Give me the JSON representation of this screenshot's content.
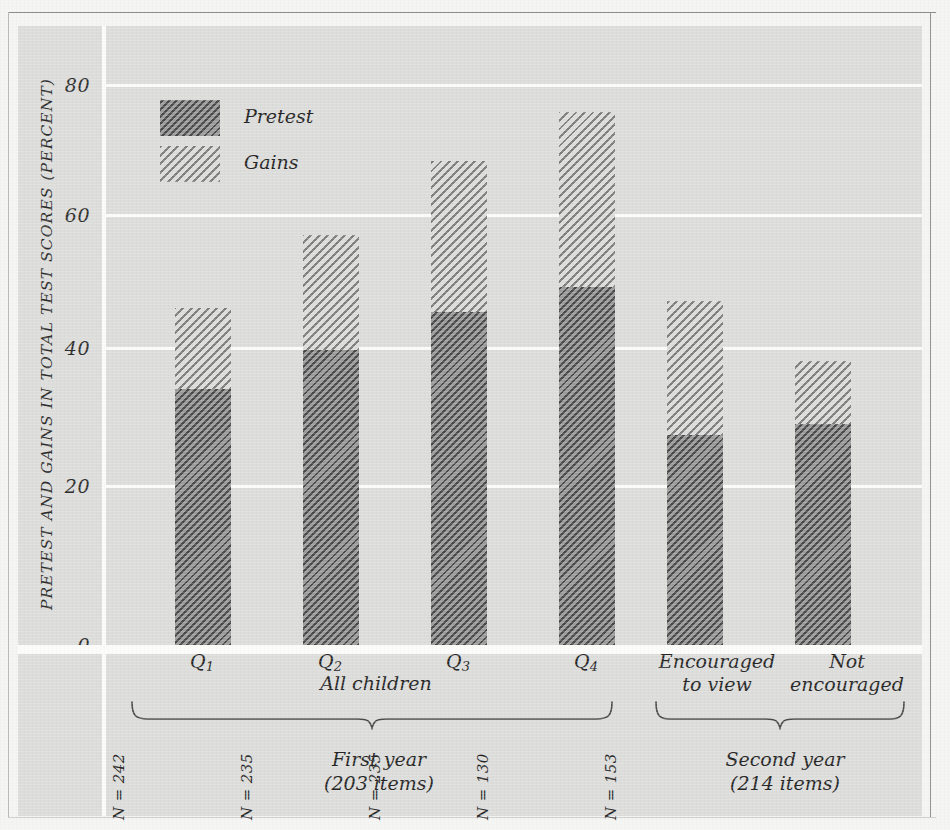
{
  "chart_data": {
    "type": "bar",
    "subtype": "stacked-bar",
    "title": "",
    "xlabel": "",
    "ylabel": "PRETEST AND GAINS IN TOTAL TEST SCORES (PERCENT)",
    "ylim": [
      0,
      88
    ],
    "yticks": [
      0,
      20,
      40,
      60,
      80
    ],
    "ytick_labels": [
      "0",
      "20",
      "40",
      "60",
      "80"
    ],
    "grid": "horizontal",
    "legend_position": "inside-top-left",
    "categories": [
      "Q1",
      "Q2",
      "Q3",
      "Q4",
      "Encouraged to view",
      "Not encouraged"
    ],
    "series": [
      {
        "name": "Pretest",
        "values": [
          36.5,
          42.0,
          47.5,
          51.0,
          30.0,
          31.5
        ]
      },
      {
        "name": "Gains",
        "values": [
          11.5,
          16.5,
          21.5,
          25.0,
          19.0,
          9.0
        ]
      }
    ],
    "totals": [
      48.0,
      58.5,
      69.0,
      76.0,
      49.0,
      40.5
    ],
    "annotations": [
      "N = 231",
      "N = 242",
      "N = 235",
      "N = 235",
      "N = 130",
      "N = 153"
    ],
    "groups": [
      {
        "label": "All children",
        "members": [
          "Q1",
          "Q2",
          "Q3",
          "Q4"
        ]
      },
      {
        "label": "First year\n(203 items)",
        "members": [
          "Q1",
          "Q2",
          "Q3",
          "Q4"
        ]
      },
      {
        "label": "Second year\n(214 items)",
        "members": [
          "Encouraged to view",
          "Not encouraged"
        ]
      }
    ]
  },
  "axis": {
    "y_title": "PRETEST AND GAINS IN TOTAL TEST SCORES (PERCENT)",
    "ticks": {
      "t80": "80",
      "t60": "60",
      "t40": "40",
      "t20": "20",
      "t0": "0"
    }
  },
  "legend": {
    "pretest_label": "Pretest",
    "gains_label": "Gains"
  },
  "bars": [
    {
      "id": "q1",
      "n_label": "N = 231",
      "pretest": 36.5,
      "gains": 11.5,
      "total": 48.0
    },
    {
      "id": "q2",
      "n_label": "N = 242",
      "pretest": 42.0,
      "gains": 16.5,
      "total": 58.5
    },
    {
      "id": "q3",
      "n_label": "N = 235",
      "pretest": 47.5,
      "gains": 21.5,
      "total": 69.0
    },
    {
      "id": "q4",
      "n_label": "N = 235",
      "pretest": 51.0,
      "gains": 25.0,
      "total": 76.0
    },
    {
      "id": "enc",
      "n_label": "N = 130",
      "pretest": 30.0,
      "gains": 19.0,
      "total": 49.0
    },
    {
      "id": "notenc",
      "n_label": "N = 153",
      "pretest": 31.5,
      "gains": 9.0,
      "total": 40.5
    }
  ],
  "categories": {
    "q1_main": "Q",
    "q1_sub": "1",
    "q2_main": "Q",
    "q2_sub": "2",
    "q3_main": "Q",
    "q3_sub": "3",
    "q4_main": "Q",
    "q4_sub": "4",
    "enc_line1": "Encouraged",
    "enc_line2": "to view",
    "notenc_line1": "Not",
    "notenc_line2": "encouraged"
  },
  "groups": {
    "all_children": "All children",
    "first_year_line1": "First year",
    "first_year_line2": "(203 items)",
    "second_year_line1": "Second year",
    "second_year_line2": "(214 items)"
  },
  "colors": {
    "paper": "#f4f4f2",
    "panel": "#dcdcda",
    "gridline": "#fbfbfa",
    "pretest_fill": "#9b9b9b",
    "gains_fill": "#dcdcda",
    "hatch_dark": "#3c3c3c",
    "hatch_light": "#6e6e6e",
    "text": "#262626",
    "rule": "#8d8d8d"
  }
}
